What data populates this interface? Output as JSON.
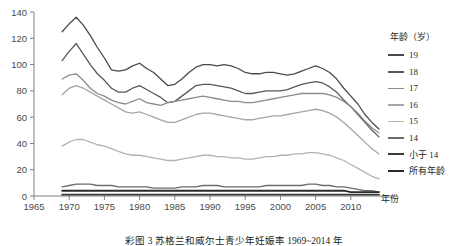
{
  "caption": "彩图 3  苏格兰和威尔士青少年妊娠率  1969~2014 年",
  "axis": {
    "x_title": "年份",
    "y_ticks": [
      "0",
      "20",
      "40",
      "60",
      "80",
      "100",
      "120",
      "140"
    ],
    "x_ticks": [
      "1965",
      "1970",
      "1975",
      "1980",
      "1985",
      "1990",
      "1995",
      "2000",
      "2005",
      "2010"
    ]
  },
  "legend": {
    "title": "年龄（岁）",
    "entries": [
      {
        "label": "19",
        "color": "#4a4a4a"
      },
      {
        "label": "18",
        "color": "#595959"
      },
      {
        "label": "17",
        "color": "#8c8c8c"
      },
      {
        "label": "16",
        "color": "#a6a6a6"
      },
      {
        "label": "15",
        "color": "#b3b3b3"
      },
      {
        "label": "14",
        "color": "#6b6b6b"
      },
      {
        "label": "小于 14",
        "color": "#3a3a3a"
      },
      {
        "label": "所有年龄",
        "color": "#2b2b2b"
      }
    ]
  },
  "chart_data": {
    "type": "line",
    "title": "彩图 3  苏格兰和威尔士青少年妊娠率  1969~2014 年",
    "xlabel": "年份",
    "ylabel": "",
    "xlim": [
      1965,
      2014
    ],
    "ylim": [
      0,
      140
    ],
    "grid": false,
    "legend_position": "right",
    "x": [
      1969,
      1970,
      1971,
      1972,
      1973,
      1974,
      1975,
      1976,
      1977,
      1978,
      1979,
      1980,
      1981,
      1982,
      1983,
      1984,
      1985,
      1986,
      1987,
      1988,
      1989,
      1990,
      1991,
      1992,
      1993,
      1994,
      1995,
      1996,
      1997,
      1998,
      1999,
      2000,
      2001,
      2002,
      2003,
      2004,
      2005,
      2006,
      2007,
      2008,
      2009,
      2010,
      2011,
      2012,
      2013,
      2014
    ],
    "series": [
      {
        "name": "19",
        "color": "#4a4a4a",
        "values": [
          125,
          131,
          136,
          130,
          122,
          113,
          105,
          96,
          95,
          96,
          99,
          101,
          97,
          94,
          89,
          84,
          85,
          89,
          94,
          98,
          100,
          100,
          99,
          100,
          99,
          97,
          94,
          93,
          93,
          94,
          94,
          93,
          92,
          93,
          95,
          97,
          99,
          97,
          94,
          89,
          82,
          76,
          70,
          62,
          56,
          51
        ]
      },
      {
        "name": "18",
        "color": "#595959",
        "values": [
          103,
          110,
          116,
          108,
          100,
          93,
          88,
          82,
          79,
          79,
          82,
          84,
          81,
          78,
          75,
          71,
          72,
          76,
          80,
          84,
          85,
          85,
          84,
          83,
          82,
          80,
          78,
          78,
          79,
          80,
          80,
          80,
          81,
          83,
          85,
          86,
          87,
          86,
          83,
          79,
          73,
          68,
          62,
          56,
          50,
          45
        ]
      },
      {
        "name": "17",
        "color": "#8c8c8c",
        "values": [
          89,
          92,
          93,
          88,
          82,
          78,
          76,
          73,
          71,
          70,
          72,
          74,
          71,
          70,
          69,
          71,
          72,
          73,
          74,
          75,
          76,
          75,
          74,
          73,
          72,
          72,
          71,
          71,
          72,
          73,
          74,
          75,
          76,
          77,
          78,
          78,
          78,
          78,
          77,
          75,
          72,
          68,
          63,
          57,
          52,
          48
        ]
      },
      {
        "name": "16",
        "color": "#a6a6a6",
        "values": [
          77,
          82,
          84,
          82,
          79,
          76,
          73,
          70,
          67,
          64,
          63,
          64,
          62,
          60,
          58,
          56,
          56,
          58,
          60,
          62,
          63,
          63,
          62,
          61,
          60,
          59,
          58,
          58,
          59,
          60,
          61,
          61,
          62,
          63,
          64,
          65,
          66,
          65,
          63,
          60,
          56,
          51,
          46,
          41,
          36,
          32
        ]
      },
      {
        "name": "15",
        "color": "#b3b3b3",
        "values": [
          38,
          41,
          43,
          43,
          41,
          39,
          38,
          36,
          34,
          32,
          31,
          31,
          30,
          29,
          28,
          27,
          27,
          28,
          29,
          30,
          31,
          31,
          30,
          30,
          29,
          29,
          28,
          28,
          29,
          30,
          30,
          31,
          31,
          32,
          32,
          33,
          33,
          32,
          31,
          29,
          27,
          24,
          21,
          18,
          15,
          13
        ]
      },
      {
        "name": "14",
        "color": "#6b6b6b",
        "values": [
          7,
          8,
          9,
          9,
          9,
          8,
          8,
          8,
          7,
          7,
          7,
          7,
          7,
          6,
          6,
          6,
          6,
          7,
          7,
          7,
          8,
          8,
          8,
          7,
          7,
          7,
          7,
          7,
          7,
          8,
          8,
          8,
          8,
          8,
          8,
          9,
          9,
          8,
          8,
          7,
          7,
          6,
          5,
          4,
          4,
          3
        ]
      },
      {
        "name": "小于 14",
        "color": "#3a3a3a",
        "values": [
          1,
          1,
          1,
          1,
          1,
          1,
          1,
          1,
          1,
          1,
          1,
          1,
          1,
          1,
          1,
          1,
          1,
          1,
          1,
          1,
          1,
          1,
          1,
          1,
          1,
          1,
          1,
          1,
          1,
          1,
          1,
          1,
          1,
          1,
          1,
          1,
          1,
          1,
          1,
          1,
          1,
          1,
          1,
          1,
          1,
          1
        ]
      },
      {
        "name": "所有年龄",
        "color": "#2b2b2b",
        "values": [
          4,
          4,
          4,
          4,
          4,
          4,
          4,
          4,
          4,
          4,
          4,
          4,
          4,
          4,
          4,
          4,
          4,
          4,
          4,
          4,
          4,
          4,
          4,
          4,
          4,
          4,
          4,
          4,
          4,
          4,
          4,
          4,
          4,
          4,
          4,
          4,
          4,
          4,
          4,
          4,
          4,
          3,
          3,
          3,
          3,
          3
        ]
      }
    ]
  }
}
